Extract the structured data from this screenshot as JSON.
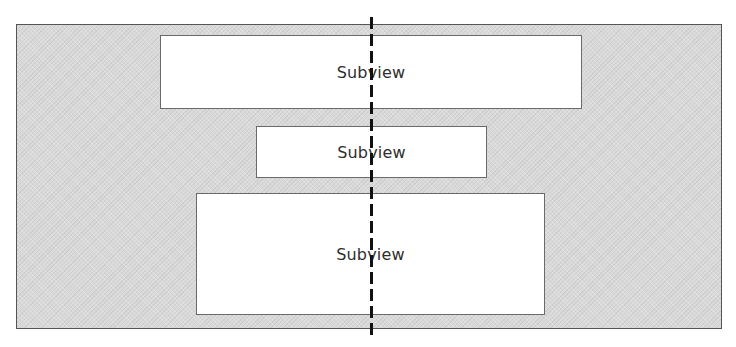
{
  "diagram": {
    "superview": {
      "fill": "#d9d9d9",
      "border": "#555555"
    },
    "subviews": [
      {
        "label": "Subview",
        "left": 160,
        "top": 35,
        "width": 422,
        "height": 74
      },
      {
        "label": "Subview",
        "left": 256,
        "top": 126,
        "width": 231,
        "height": 52
      },
      {
        "label": "Subview",
        "left": 196,
        "top": 193,
        "width": 349,
        "height": 122
      }
    ],
    "center_axis": {
      "style": "dashed",
      "color": "#111111",
      "x": 371
    }
  }
}
